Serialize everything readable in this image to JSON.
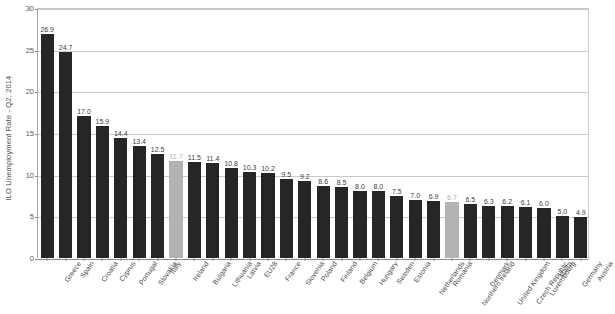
{
  "chart": {
    "title": "",
    "subtitle": "",
    "y_axis_title": "ILO Unemployment Rate - Q2, 2014",
    "x_axis_title": ""
  },
  "chart_data": {
    "type": "bar",
    "title": "",
    "xlabel": "",
    "ylabel": "ILO Unemployment Rate - Q2, 2014",
    "ylim": [
      0,
      30
    ],
    "yticks": [
      0,
      5,
      10,
      15,
      20,
      25,
      30
    ],
    "grid": true,
    "legend": "none",
    "value_labels": true,
    "orientation": "vertical",
    "sorted": "descending",
    "categories": [
      "Greece",
      "Spain",
      "Croatia",
      "Cyprus",
      "Portugal",
      "Slovakia",
      "Italy",
      "Ireland",
      "Bulgaria",
      "Lithuania",
      "Latvia",
      "EU28",
      "France",
      "Slovenia",
      "Poland",
      "Finland",
      "Belgium",
      "Hungary",
      "Sweden",
      "Estonia",
      "Netherlands",
      "Romania",
      "Northern Ireland",
      "Denmark",
      "United Kingdom",
      "Czech Republic",
      "Luxembourg",
      "Malta",
      "Germany",
      "Austria"
    ],
    "values": [
      26.9,
      24.7,
      17.0,
      15.9,
      14.4,
      13.4,
      12.5,
      11.7,
      11.5,
      11.4,
      10.8,
      10.3,
      10.2,
      9.5,
      9.2,
      8.6,
      8.5,
      8.0,
      8.0,
      7.5,
      7.0,
      6.9,
      6.7,
      6.5,
      6.3,
      6.2,
      6.1,
      6.0,
      5.0,
      4.9
    ],
    "value_label_text": [
      "26.9",
      "24.7",
      "17.0",
      "15.9",
      "14.4",
      "13.4",
      "12.5",
      "11.7",
      "11.5",
      "11.4",
      "10.8",
      "10.3",
      "10.2",
      "9.5",
      "9.2",
      "8.6",
      "8.5",
      "8.0",
      "8.0",
      "7.5",
      "7.0",
      "6.9",
      "6.7",
      "6.5",
      "6.3",
      "6.2",
      "6.1",
      "6.0",
      "5.0",
      "4.9"
    ],
    "highlighted_categories": [
      "Ireland",
      "Northern Ireland"
    ],
    "colors": {
      "bar": "#262626",
      "bar_highlight": "#b3b3b3",
      "gridline": "#c9c9c9",
      "axis": "#8f8f8f",
      "text": "#4a4a4a"
    },
    "ytick_labels": [
      "0",
      "5",
      "10",
      "15",
      "20",
      "25",
      "30"
    ]
  }
}
